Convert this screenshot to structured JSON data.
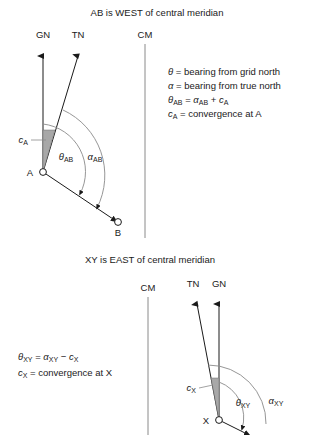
{
  "figure": {
    "panels": [
      {
        "id": "west-panel",
        "title": "AB is WEST of central meridian",
        "labels": {
          "grid_north": "GN",
          "true_north": "TN",
          "central_meridian": "CM",
          "station_from": "A",
          "station_to": "B",
          "convergence": "c",
          "convergence_sub": "A",
          "theta": "θ",
          "theta_sub": "AB",
          "alpha": "α",
          "alpha_sub": "AB"
        },
        "legend": [
          {
            "sym": "θ",
            "sub": "",
            "text": " = bearing from grid north"
          },
          {
            "sym": "α",
            "sub": "",
            "text": " = bearing from true north"
          },
          {
            "sym": "θ",
            "sub": "AB",
            "text": " = α",
            "tail_sub": "AB",
            "tail": " + c",
            "tail2_sub": "A"
          },
          {
            "sym": "c",
            "sub": "A",
            "text": " = convergence at A"
          }
        ],
        "legend_lines": [
          "θ = bearing from grid north",
          "α = bearing from true north",
          "θAB = αAB + cA",
          "cA = convergence at A"
        ]
      },
      {
        "id": "east-panel",
        "title": "XY is EAST of central meridian",
        "labels": {
          "grid_north": "GN",
          "true_north": "TN",
          "central_meridian": "CM",
          "station_from": "X",
          "convergence": "c",
          "convergence_sub": "X",
          "theta": "θ",
          "theta_sub": "XY",
          "alpha": "α",
          "alpha_sub": "XY"
        },
        "legend_lines": [
          "θXY = αXY − cX",
          "cX = convergence at X"
        ]
      }
    ],
    "colors": {
      "ink": "#1a1a1a",
      "guide": "#8a8a8a",
      "wedge_fill": "#a8a8a8"
    }
  }
}
